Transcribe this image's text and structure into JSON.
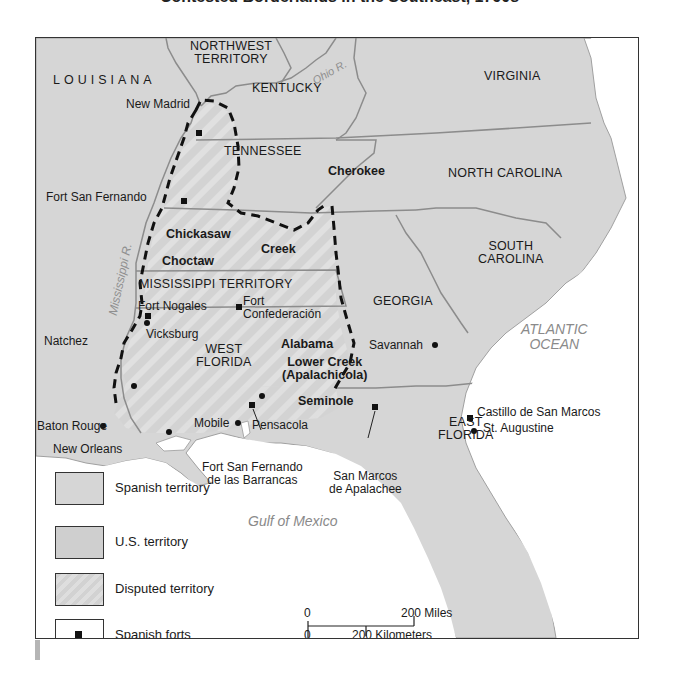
{
  "title": "Contested Borderlands in the Southeast, 1790s",
  "colors": {
    "spanish_territory": "#d6d6d6",
    "us_territory": "#cfcfcf",
    "disputed_territory": "#dadada",
    "water": "#ffffff",
    "border": "#8c8c8c",
    "disputed_boundary": "#111111",
    "water_label": "#8a8a8a"
  },
  "regions": {
    "northwest_territory": "NORTHWEST\nTERRITORY",
    "northwest_line1": "NORTHWEST",
    "northwest_line2": "TERRITORY",
    "louisiana": "LOUISIANA",
    "kentucky": "KENTUCKY",
    "virginia": "VIRGINIA",
    "tennessee": "TENNESSEE",
    "north_carolina": "NORTH CAROLINA",
    "south_carolina_line1": "SOUTH",
    "south_carolina_line2": "CAROLINA",
    "mississippi_territory": "MISSISSIPPI TERRITORY",
    "georgia": "GEORGIA",
    "west_florida_line1": "WEST",
    "west_florida_line2": "FLORIDA",
    "east_florida_line1": "EAST",
    "east_florida_line2": "FLORIDA"
  },
  "tribes": {
    "cherokee": "Cherokee",
    "chickasaw": "Chickasaw",
    "creek": "Creek",
    "choctaw": "Choctaw",
    "alabama": "Alabama",
    "lower_creek_line1": "Lower Creek",
    "lower_creek_line2": "(Apalachicola)",
    "seminole": "Seminole"
  },
  "water": {
    "ohio_river": "Ohio R.",
    "mississippi_river": "Mississippi R.",
    "atlantic_line1": "ATLANTIC",
    "atlantic_line2": "OCEAN",
    "gulf": "Gulf of Mexico"
  },
  "places": {
    "new_madrid": "New Madrid",
    "fort_san_fernando": "Fort San Fernando",
    "fort_nogales": "Fort Nogales",
    "fort_confederacion_line1": "Fort",
    "fort_confederacion_line2": "Confederación",
    "natchez": "Natchez",
    "vicksburg": "Vicksburg",
    "baton_rouge": "Baton Rouge",
    "new_orleans": "New Orleans",
    "mobile": "Mobile",
    "pensacola": "Pensacola",
    "fort_barrancas_line1": "Fort San Fernando",
    "fort_barrancas_line2": "de las Barrancas",
    "san_marcos_line1": "San Marcos",
    "san_marcos_line2": "de Apalachee",
    "savannah": "Savannah",
    "castillo": "Castillo de San Marcos",
    "st_augustine": "St. Augustine"
  },
  "legend": {
    "items": [
      {
        "label": "Spanish territory",
        "swatch": "spanish"
      },
      {
        "label": "U.S. territory",
        "swatch": "us"
      },
      {
        "label": "Disputed territory",
        "swatch": "disputed"
      },
      {
        "label": "Spanish forts",
        "swatch": "fort-icon"
      }
    ]
  },
  "scale": {
    "miles_zero": "0",
    "miles_label": "200 Miles",
    "km_zero": "0",
    "km_label": "200 Kilometers"
  }
}
